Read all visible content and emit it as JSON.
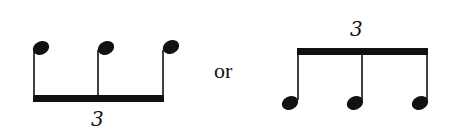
{
  "diagram": {
    "colors": {
      "ink": "#111111",
      "background": "#ffffff"
    },
    "left_group": {
      "description": "Three stem-up notes beamed at the bottom",
      "tuplet_number": "3",
      "note_count": 3,
      "stem_direction": "up",
      "beam_position": "below"
    },
    "separator": {
      "text": "or"
    },
    "right_group": {
      "description": "Three stem-down notes beamed at the top",
      "tuplet_number": "3",
      "note_count": 3,
      "stem_direction": "down",
      "beam_position": "above"
    }
  }
}
